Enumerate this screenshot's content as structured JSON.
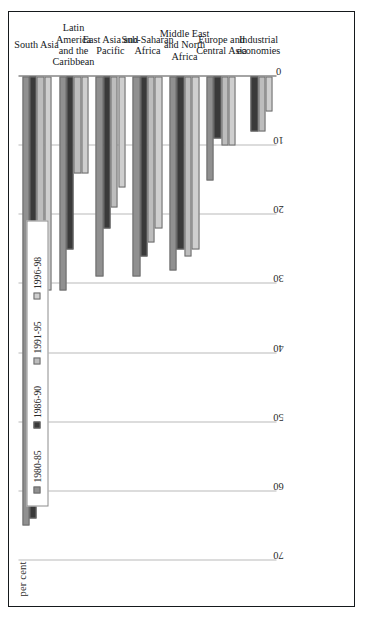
{
  "figure": {
    "axis_label": "per cent",
    "border_color": "#15191c"
  },
  "chart_data": {
    "type": "bar",
    "orientation": "horizontal",
    "title": "",
    "xlabel": "per cent",
    "ylabel": "",
    "xlim": [
      0,
      70
    ],
    "xticks": [
      70,
      60,
      50,
      40,
      30,
      20,
      10,
      0
    ],
    "xtick_labels": [
      "70",
      "60",
      "50",
      "40",
      "30",
      "20",
      "10",
      "0"
    ],
    "axis_reversed": true,
    "grid": true,
    "legend_position": "top-left",
    "categories": [
      "South Asia",
      "Latin America and the Caribbean",
      "East Asia and Pacific",
      "Sub-Saharan Africa",
      "Middle East and North Africa",
      "Europe and Central Asia",
      "Industrial economies"
    ],
    "category_label_lines": [
      [
        "South Asia"
      ],
      [
        "Latin America",
        "and the",
        "Caribbean"
      ],
      [
        "East Asia and",
        "Pacific"
      ],
      [
        "Sub-Saharan",
        "Africa"
      ],
      [
        "Middle East",
        "and North",
        "Africa"
      ],
      [
        "Europe and",
        "Central Asia"
      ],
      [
        "Industrial",
        "economies"
      ]
    ],
    "series": [
      {
        "name": "1980-85",
        "color": "#909090",
        "values": [
          65,
          31,
          29,
          29,
          28,
          15,
          0
        ]
      },
      {
        "name": "1986-90",
        "color": "#3a3a3a",
        "values": [
          64,
          25,
          22,
          26,
          25,
          9,
          8
        ]
      },
      {
        "name": "1991-95",
        "color": "#bdbdbd",
        "values": [
          40,
          14,
          19,
          24,
          26,
          10,
          8
        ]
      },
      {
        "name": "1996-98",
        "color": "#cfcfcf",
        "values": [
          31,
          14,
          16,
          22,
          25,
          10,
          5
        ]
      }
    ]
  },
  "legend": {
    "items": [
      {
        "label": "1980-85",
        "color": "#909090"
      },
      {
        "label": "1986-90",
        "color": "#3a3a3a"
      },
      {
        "label": "1991-95",
        "color": "#bdbdbd"
      },
      {
        "label": "1996-98",
        "color": "#cfcfcf"
      }
    ]
  }
}
